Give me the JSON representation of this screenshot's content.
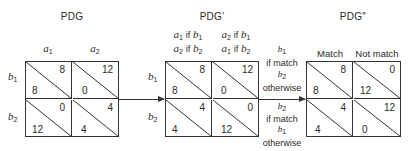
{
  "matrices": [
    {
      "title": "PDG",
      "columns": [
        {
          "lines": [
            {
              "sym": "a",
              "sub": "1"
            }
          ]
        },
        {
          "lines": [
            {
              "sym": "a",
              "sub": "2"
            }
          ]
        }
      ],
      "rows": [
        {
          "sym": "b",
          "sub": "1"
        },
        {
          "sym": "b",
          "sub": "2"
        }
      ],
      "cells": [
        [
          {
            "upper": "8",
            "lower": "8"
          },
          {
            "upper": "12",
            "lower": "0"
          }
        ],
        [
          {
            "upper": "0",
            "lower": "12"
          },
          {
            "upper": "4",
            "lower": "4"
          }
        ]
      ]
    },
    {
      "title": "PDG′",
      "columns": [
        {
          "line1": {
            "sym": "a",
            "sub": "1",
            "cond": "if",
            "csym": "b",
            "csub": "1"
          },
          "line2": {
            "sym": "a",
            "sub": "2",
            "cond": "if",
            "csym": "b",
            "csub": "2"
          }
        },
        {
          "line1": {
            "sym": "a",
            "sub": "2",
            "cond": "if",
            "csym": "b",
            "csub": "1"
          },
          "line2": {
            "sym": "a",
            "sub": "1",
            "cond": "if",
            "csym": "b",
            "csub": "2"
          }
        }
      ],
      "rows": [
        {
          "sym": "b",
          "sub": "1"
        },
        {
          "sym": "b",
          "sub": "2"
        }
      ],
      "cells": [
        [
          {
            "upper": "8",
            "lower": "8"
          },
          {
            "upper": "12",
            "lower": "0"
          }
        ],
        [
          {
            "upper": "4",
            "lower": "4"
          },
          {
            "upper": "0",
            "lower": "12"
          }
        ]
      ]
    },
    {
      "title": "PDG″",
      "columns": [
        {
          "label": "Match"
        },
        {
          "label": "Not match"
        }
      ],
      "rows": [
        {
          "line1": {
            "sym": "b",
            "sub": "1"
          },
          "line2": "if match",
          "line3": {
            "sym": "b",
            "sub": "2"
          },
          "line4": "otherwise"
        },
        {
          "line1": {
            "sym": "b",
            "sub": "2"
          },
          "line2": "if match",
          "line3": {
            "sym": "b",
            "sub": "1"
          },
          "line4": "otherwise"
        }
      ],
      "cells": [
        [
          {
            "upper": "8",
            "lower": "8"
          },
          {
            "upper": "0",
            "lower": "12"
          }
        ],
        [
          {
            "upper": "4",
            "lower": "4"
          },
          {
            "upper": "12",
            "lower": "0"
          }
        ]
      ]
    }
  ],
  "colors": {
    "line": "#333333",
    "text": "#2a2a2a",
    "background": "#ffffff"
  }
}
